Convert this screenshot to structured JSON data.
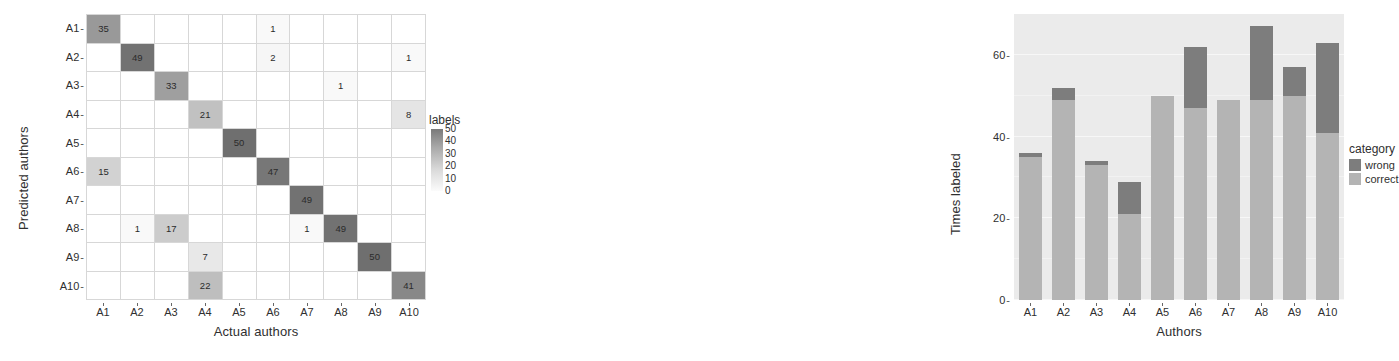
{
  "chart_data": [
    {
      "type": "heatmap",
      "title": "",
      "xlabel": "Actual authors",
      "ylabel": "Predicted authors",
      "x_categories": [
        "A1",
        "A2",
        "A3",
        "A4",
        "A5",
        "A6",
        "A7",
        "A8",
        "A9",
        "A10"
      ],
      "y_categories": [
        "A1",
        "A2",
        "A3",
        "A4",
        "A5",
        "A6",
        "A7",
        "A8",
        "A9",
        "A10"
      ],
      "legend": {
        "title": "labels",
        "position": "right",
        "ticks": [
          50,
          40,
          30,
          20,
          10,
          0
        ],
        "tick_labels": [
          "50",
          "40",
          "30",
          "20",
          "10",
          "0"
        ],
        "scale_min": 0,
        "scale_max": 50,
        "low_color": "#fcfcfc",
        "high_color": "#6f6f6f"
      },
      "grid": true,
      "matrix": [
        [
          35,
          0,
          0,
          0,
          0,
          1,
          0,
          0,
          0,
          0
        ],
        [
          0,
          49,
          0,
          0,
          0,
          2,
          0,
          0,
          0,
          1
        ],
        [
          0,
          0,
          33,
          0,
          0,
          0,
          0,
          1,
          0,
          0
        ],
        [
          0,
          0,
          0,
          21,
          0,
          0,
          0,
          0,
          0,
          8
        ],
        [
          0,
          0,
          0,
          0,
          50,
          0,
          0,
          0,
          0,
          0
        ],
        [
          15,
          0,
          0,
          0,
          0,
          47,
          0,
          0,
          0,
          0
        ],
        [
          0,
          0,
          0,
          0,
          0,
          0,
          49,
          0,
          0,
          0
        ],
        [
          0,
          1,
          17,
          0,
          0,
          0,
          1,
          49,
          0,
          0
        ],
        [
          0,
          0,
          0,
          7,
          0,
          0,
          0,
          0,
          50,
          0
        ],
        [
          0,
          0,
          0,
          22,
          0,
          0,
          0,
          0,
          0,
          41
        ]
      ]
    },
    {
      "type": "bar",
      "title": "",
      "xlabel": "Authors",
      "ylabel": "Times labeled",
      "categories": [
        "A1",
        "A2",
        "A3",
        "A4",
        "A5",
        "A6",
        "A7",
        "A8",
        "A9",
        "A10"
      ],
      "stacked": true,
      "ylim": [
        0,
        70
      ],
      "y_ticks": [
        0,
        20,
        40,
        60
      ],
      "y_tick_labels": [
        "0",
        "20",
        "40",
        "60"
      ],
      "grid": true,
      "legend": {
        "title": "category",
        "position": "right",
        "entries": [
          {
            "label": "wrong",
            "color": "#7d7d7d"
          },
          {
            "label": "correct",
            "color": "#b4b4b4"
          }
        ]
      },
      "series": [
        {
          "name": "correct",
          "color": "#b4b4b4",
          "values": [
            35,
            49,
            33,
            21,
            50,
            47,
            49,
            49,
            50,
            41
          ]
        },
        {
          "name": "wrong",
          "color": "#7d7d7d",
          "values": [
            1,
            3,
            1,
            8,
            0,
            15,
            0,
            18,
            7,
            22
          ]
        }
      ],
      "totals": [
        36,
        52,
        34,
        29,
        50,
        62,
        49,
        67,
        57,
        63
      ]
    }
  ],
  "matrix_panel": {
    "x_title": "Actual authors",
    "y_title": "Predicted authors",
    "legend_title": "labels",
    "tick_dash": "-"
  },
  "bar_panel": {
    "x_title": "Authors",
    "y_title": "Times labeled",
    "legend_title": "category",
    "tick_dash": "-"
  }
}
